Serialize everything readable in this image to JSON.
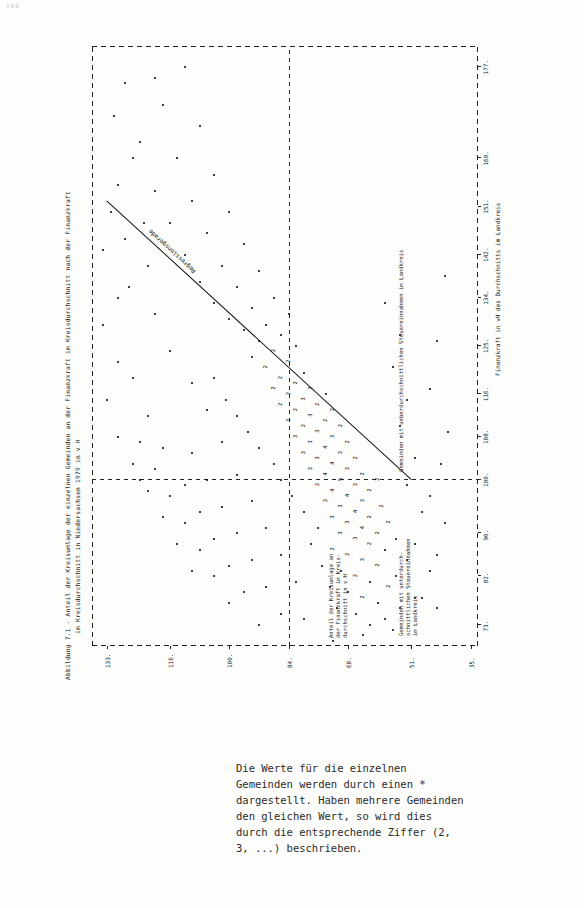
{
  "page": {
    "number": "109"
  },
  "figure": {
    "title_line1": "Abbildung 7.1 - Anteil der Kreisumlage der einzelnen Gemeinden an der Finanzkraft im Kreisdurchschnitt nach der Finanzkraft",
    "title_line2": "im Kreisdurchschnitt in Niedersachsen 1979 in v H",
    "regression_label": "Regressionsgerade",
    "y_axis_caption": "Anteil der Kreisumlage an\nder Finanzkraft im Kreis-\ndurchschnitt in v H",
    "x_axis_caption": "Finanzkraft in vH des Durchschnitts im Landkreis",
    "annotation_left": "Gemeinden mit unterdurch-\nschnittlichen Steuereinnahmen\nim Landkreis",
    "annotation_right": "Gemeinden mit ueberdurchschnittlichen Steuereinnahmen im Landkreis"
  },
  "footnote": {
    "text": "Die Werte für die einzelnen Gemeinden werden durch einen * dargestellt. Haben mehrere Gemeinden den gleichen Wert, so wird dies durch die entsprechende Ziffer (2, 3, ...) beschrieben."
  },
  "chart_data": {
    "type": "scatter",
    "title": "Abbildung 7.1 - Anteil der Kreisumlage der einzelnen Gemeinden an der Finanzkraft im Kreisdurchschnitt nach der Finanzkraft im Kreisdurchschnitt in Niedersachsen 1979 in v H",
    "xlabel": "Finanzkraft in vH des Durchschnitts im Landkreis",
    "ylabel": "Anteil der Kreisumlage an der Finanzkraft im Kreisdurchschnitt in v H",
    "xticks": [
      73,
      82,
      90,
      100,
      108,
      116,
      125,
      134,
      142,
      151,
      160,
      177
    ],
    "yticks": [
      35,
      51,
      68,
      84,
      100,
      116,
      133
    ],
    "xlim": [
      69,
      181
    ],
    "ylim": [
      33,
      137
    ],
    "grid": false,
    "reference_lines": {
      "vertical_x": 100,
      "horizontal_y": 84
    },
    "legend": "none",
    "marker": "*",
    "multiplicity_note": "Digits 2,3,... mark coincident points",
    "regression": {
      "label": "Regressionsgerade",
      "x1": 100,
      "y1": 51,
      "x2": 152,
      "y2": 133
    },
    "points": [
      [
        73,
        62,
        1
      ],
      [
        74,
        58,
        1
      ],
      [
        75,
        66,
        1
      ],
      [
        76,
        54,
        1
      ],
      [
        76,
        71,
        1
      ],
      [
        77,
        60,
        1
      ],
      [
        78,
        64,
        2
      ],
      [
        78,
        50,
        1
      ],
      [
        79,
        68,
        1
      ],
      [
        80,
        57,
        2
      ],
      [
        80,
        73,
        1
      ],
      [
        81,
        62,
        1
      ],
      [
        82,
        66,
        2
      ],
      [
        82,
        55,
        1
      ],
      [
        83,
        70,
        1
      ],
      [
        84,
        60,
        2
      ],
      [
        84,
        75,
        1
      ],
      [
        85,
        64,
        3
      ],
      [
        85,
        52,
        1
      ],
      [
        86,
        68,
        2
      ],
      [
        87,
        58,
        1
      ],
      [
        87,
        72,
        2
      ],
      [
        88,
        62,
        2
      ],
      [
        88,
        78,
        1
      ],
      [
        89,
        66,
        3
      ],
      [
        89,
        55,
        1
      ],
      [
        90,
        70,
        3
      ],
      [
        90,
        60,
        2
      ],
      [
        91,
        64,
        4
      ],
      [
        91,
        76,
        1
      ],
      [
        92,
        68,
        3
      ],
      [
        92,
        57,
        2
      ],
      [
        93,
        72,
        3
      ],
      [
        93,
        62,
        2
      ],
      [
        94,
        66,
        4
      ],
      [
        94,
        80,
        1
      ],
      [
        95,
        70,
        3
      ],
      [
        95,
        59,
        2
      ],
      [
        96,
        74,
        3
      ],
      [
        96,
        64,
        3
      ],
      [
        97,
        68,
        4
      ],
      [
        97,
        83,
        1
      ],
      [
        98,
        72,
        4
      ],
      [
        98,
        62,
        2
      ],
      [
        99,
        76,
        3
      ],
      [
        99,
        66,
        3
      ],
      [
        100,
        70,
        5
      ],
      [
        100,
        60,
        2
      ],
      [
        100,
        86,
        1
      ],
      [
        101,
        74,
        4
      ],
      [
        101,
        64,
        2
      ],
      [
        102,
        78,
        3
      ],
      [
        102,
        68,
        3
      ],
      [
        103,
        72,
        4
      ],
      [
        103,
        88,
        1
      ],
      [
        104,
        76,
        3
      ],
      [
        104,
        66,
        2
      ],
      [
        105,
        80,
        3
      ],
      [
        105,
        70,
        3
      ],
      [
        106,
        74,
        4
      ],
      [
        106,
        92,
        1
      ],
      [
        107,
        78,
        3
      ],
      [
        107,
        68,
        2
      ],
      [
        108,
        82,
        3
      ],
      [
        108,
        72,
        3
      ],
      [
        109,
        76,
        3
      ],
      [
        109,
        95,
        1
      ],
      [
        110,
        80,
        2
      ],
      [
        110,
        70,
        2
      ],
      [
        111,
        84,
        3
      ],
      [
        111,
        74,
        2
      ],
      [
        112,
        78,
        3
      ],
      [
        112,
        98,
        1
      ],
      [
        113,
        82,
        2
      ],
      [
        113,
        72,
        2
      ],
      [
        114,
        86,
        2
      ],
      [
        114,
        76,
        2
      ],
      [
        115,
        80,
        3
      ],
      [
        115,
        101,
        1
      ],
      [
        116,
        84,
        2
      ],
      [
        116,
        74,
        1
      ],
      [
        117,
        88,
        2
      ],
      [
        117,
        78,
        2
      ],
      [
        118,
        82,
        2
      ],
      [
        119,
        86,
        2
      ],
      [
        119,
        104,
        1
      ],
      [
        120,
        80,
        1
      ],
      [
        121,
        90,
        2
      ],
      [
        122,
        84,
        2
      ],
      [
        123,
        94,
        1
      ],
      [
        124,
        88,
        2
      ],
      [
        125,
        82,
        1
      ],
      [
        126,
        92,
        1
      ],
      [
        127,
        86,
        1
      ],
      [
        128,
        96,
        1
      ],
      [
        129,
        90,
        1
      ],
      [
        130,
        100,
        1
      ],
      [
        131,
        84,
        1
      ],
      [
        132,
        94,
        1
      ],
      [
        133,
        104,
        1
      ],
      [
        134,
        88,
        1
      ],
      [
        136,
        98,
        1
      ],
      [
        137,
        108,
        1
      ],
      [
        139,
        92,
        1
      ],
      [
        140,
        102,
        1
      ],
      [
        142,
        112,
        1
      ],
      [
        144,
        96,
        1
      ],
      [
        146,
        106,
        1
      ],
      [
        148,
        116,
        1
      ],
      [
        150,
        100,
        1
      ],
      [
        152,
        110,
        1
      ],
      [
        154,
        120,
        1
      ],
      [
        157,
        104,
        1
      ],
      [
        160,
        114,
        1
      ],
      [
        163,
        124,
        1
      ],
      [
        166,
        108,
        1
      ],
      [
        170,
        118,
        1
      ],
      [
        174,
        128,
        1
      ],
      [
        177,
        112,
        1
      ],
      [
        117,
        46,
        1
      ],
      [
        126,
        44,
        1
      ],
      [
        138,
        42,
        1
      ],
      [
        100,
        124,
        1
      ],
      [
        106,
        118,
        1
      ],
      [
        112,
        122,
        1
      ],
      [
        119,
        126,
        1
      ],
      [
        124,
        116,
        1
      ],
      [
        131,
        120,
        1
      ],
      [
        134,
        130,
        1
      ],
      [
        140,
        122,
        1
      ],
      [
        145,
        128,
        1
      ],
      [
        150,
        132,
        1
      ],
      [
        86,
        44,
        1
      ],
      [
        92,
        42,
        1
      ],
      [
        97,
        46,
        1
      ],
      [
        103,
        43,
        1
      ],
      [
        109,
        41,
        1
      ],
      [
        78,
        48,
        1
      ],
      [
        83,
        46,
        1
      ],
      [
        88,
        50,
        1
      ],
      [
        94,
        48,
        1
      ],
      [
        99,
        52,
        1
      ],
      [
        104,
        50,
        1
      ],
      [
        110,
        54,
        1
      ],
      [
        115,
        52,
        1
      ],
      [
        121,
        56,
        1
      ],
      [
        127,
        54,
        1
      ],
      [
        133,
        58,
        1
      ],
      [
        70,
        72,
        1
      ],
      [
        71,
        64,
        1
      ],
      [
        72,
        56,
        1
      ],
      [
        74,
        80,
        1
      ],
      [
        76,
        44,
        1
      ],
      [
        81,
        82,
        1
      ],
      [
        86,
        86,
        1
      ],
      [
        91,
        90,
        1
      ],
      [
        96,
        94,
        1
      ],
      [
        101,
        98,
        1
      ],
      [
        107,
        102,
        1
      ],
      [
        113,
        106,
        1
      ],
      [
        118,
        110,
        1
      ],
      [
        80,
        90,
        1
      ],
      [
        85,
        94,
        1
      ],
      [
        90,
        98,
        1
      ],
      [
        95,
        102,
        1
      ],
      [
        100,
        106,
        1
      ],
      [
        105,
        110,
        1
      ],
      [
        75,
        86,
        1
      ],
      [
        79,
        96,
        1
      ],
      [
        84,
        100,
        1
      ],
      [
        89,
        104,
        1
      ],
      [
        94,
        108,
        1
      ],
      [
        99,
        112,
        1
      ],
      [
        83,
        110,
        1
      ],
      [
        88,
        114,
        1
      ],
      [
        93,
        118,
        1
      ],
      [
        98,
        122,
        1
      ],
      [
        103,
        126,
        1
      ],
      [
        108,
        130,
        1
      ],
      [
        115,
        133,
        1
      ],
      [
        122,
        130,
        1
      ],
      [
        129,
        134,
        1
      ],
      [
        136,
        127,
        1
      ],
      [
        143,
        134,
        1
      ],
      [
        155,
        130,
        1
      ],
      [
        148,
        123,
        1
      ],
      [
        160,
        126,
        1
      ],
      [
        168,
        131,
        1
      ],
      [
        175,
        120,
        1
      ],
      [
        73,
        92,
        1
      ],
      [
        77,
        100,
        1
      ],
      [
        82,
        104,
        1
      ],
      [
        87,
        108,
        1
      ],
      [
        92,
        112,
        1
      ],
      [
        97,
        116,
        1
      ],
      [
        102,
        120,
        1
      ],
      [
        107,
        124,
        1
      ]
    ]
  }
}
